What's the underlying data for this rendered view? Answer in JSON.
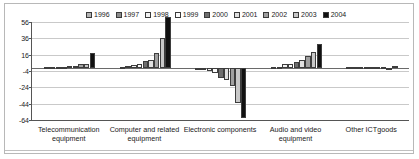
{
  "chart_data": {
    "type": "bar",
    "title": "",
    "subtitle": "",
    "xlabel": "",
    "ylabel": "",
    "ylim": [
      -64,
      56
    ],
    "yticks": [
      56,
      36,
      16,
      -4,
      -24,
      -44,
      -64
    ],
    "ytick_labels": [
      "56",
      "36",
      "16",
      "-4",
      "-24",
      "-44",
      "-64"
    ],
    "grid": true,
    "legend_position": "top",
    "categories": [
      "Telecommunication equipment",
      "Computer and related equipment",
      "Electronic components",
      "Audio and video equipment",
      "Other ICTgoods"
    ],
    "series": [
      {
        "name": "1996",
        "color": "#b4b4b4",
        "values": [
          0.4,
          1.5,
          -0.6,
          0.5,
          0.3
        ]
      },
      {
        "name": "1997",
        "color": "#8c8c8c",
        "values": [
          0.6,
          2.2,
          -1.0,
          1.0,
          0.4
        ]
      },
      {
        "name": "1998",
        "color": "#f2f2f2",
        "values": [
          0.8,
          3.0,
          -3.5,
          4.5,
          0.5
        ]
      },
      {
        "name": "1999",
        "color": "#fbfbfb",
        "values": [
          1.0,
          4.5,
          -7.0,
          5.0,
          0.6
        ]
      },
      {
        "name": "2000",
        "color": "#6e6e6e",
        "values": [
          1.6,
          8.0,
          -12.0,
          6.5,
          0.7
        ]
      },
      {
        "name": "2001",
        "color": "#e0e0e0",
        "values": [
          2.2,
          9.5,
          -15.0,
          9.0,
          0.8
        ]
      },
      {
        "name": "2002",
        "color": "#a0a0a0",
        "values": [
          4.0,
          18.0,
          -22.0,
          14.0,
          0.5
        ]
      },
      {
        "name": "2003",
        "color": "#c8c8c8",
        "values": [
          5.0,
          37.0,
          -43.0,
          19.0,
          -0.5
        ]
      },
      {
        "name": "2004",
        "color": "#111111",
        "values": [
          18.0,
          62.0,
          -62.0,
          29.0,
          2.5
        ]
      }
    ]
  }
}
